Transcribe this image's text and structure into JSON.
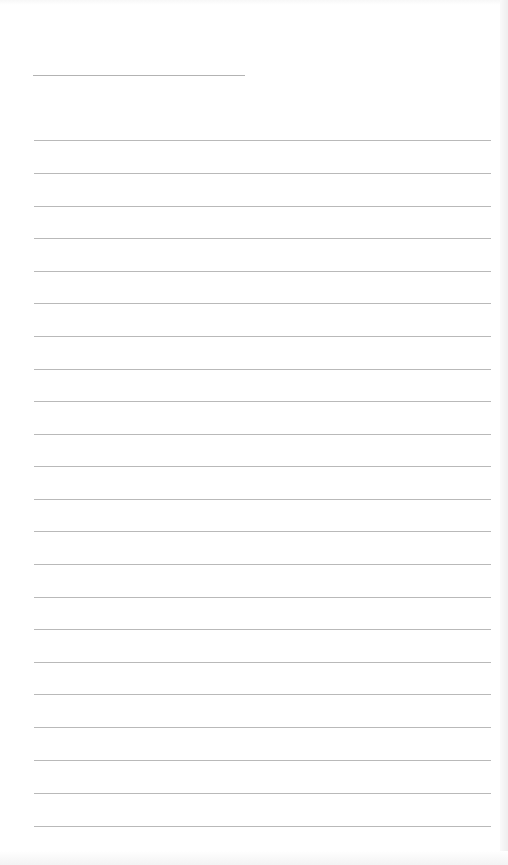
{
  "document": {
    "type": "lined-notepaper",
    "background_color": "#ffffff",
    "rule_color": "#b9b9b9",
    "header_rule": {
      "x": 33,
      "y": 75,
      "width": 212
    },
    "body_rules": {
      "x": 34,
      "width": 457,
      "y_positions": [
        140,
        173,
        206,
        238,
        271,
        303,
        336,
        369,
        401,
        434,
        466,
        499,
        531,
        564,
        597,
        629,
        662,
        694,
        727,
        760,
        793,
        826
      ]
    }
  }
}
